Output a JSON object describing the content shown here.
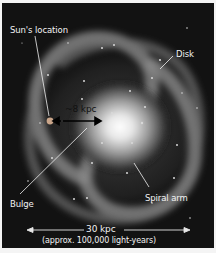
{
  "diagram": {
    "labels": {
      "sun": "Sun's location",
      "disk": "Disk",
      "bulge": "Bulge",
      "spiral_arm": "Spiral arm",
      "sun_distance": "~8 kpc",
      "diameter": "30 kpc",
      "diameter_note": "(approx. 100,000 light-years)"
    },
    "colors": {
      "background": "#121212",
      "text": "#f2f2f2",
      "border": "#f4f4f4"
    }
  }
}
